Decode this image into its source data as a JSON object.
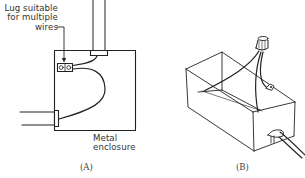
{
  "figure": {
    "panel_a": {
      "caption": "(A)",
      "labels": {
        "lug_line1": "Lug suitable",
        "lug_line2": "for multiple",
        "lug_line3": "wires",
        "enclosure_line1": "Metal",
        "enclosure_line2": "enclosure"
      }
    },
    "panel_b": {
      "caption": "(B)"
    },
    "colors": {
      "stroke": "#222222",
      "background": "#ffffff"
    }
  }
}
